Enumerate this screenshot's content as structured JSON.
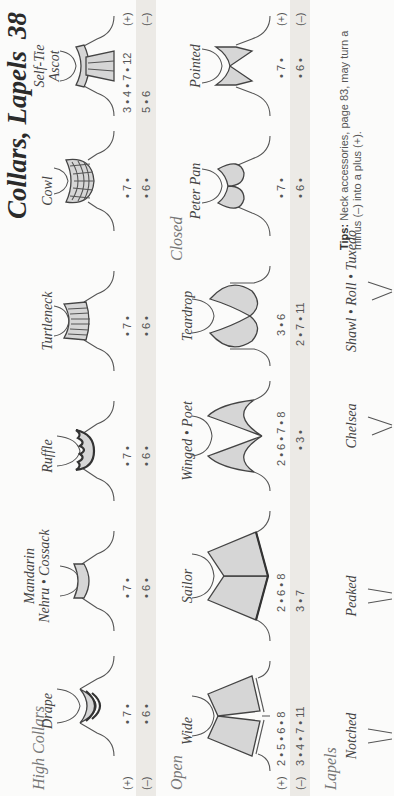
{
  "header": {
    "title": "Collars, Lapels",
    "page_number": "38"
  },
  "sections": {
    "high_collars": {
      "title": "High Collars",
      "plus_label": "(+)",
      "minus_label": "(–)",
      "items": [
        {
          "name": "Drape",
          "plus": "• 7 •",
          "minus": "• 6 •"
        },
        {
          "name": "Mandarin",
          "name_line2": "Nehru • Cossack",
          "plus": "• 7 •",
          "minus": "• 6 •"
        },
        {
          "name": "Ruffle",
          "plus": "• 7 •",
          "minus": "• 6 •"
        },
        {
          "name": "Turtleneck",
          "plus": "• 7 •",
          "minus": "• 6 •"
        },
        {
          "name": "Cowl",
          "plus": "• 7 •",
          "minus": "• 6 •"
        },
        {
          "name": "Self-Tie",
          "name_line2": "Ascot",
          "plus": "3 • 4 • 7 • 12",
          "minus": "5 • 6"
        }
      ],
      "right_plus": "(+)",
      "right_minus": "(–)"
    },
    "open": {
      "title": "Open",
      "plus_label": "(+)",
      "minus_label": "(–)",
      "items": [
        {
          "name": "Wide",
          "plus": "2 • 5 • 6 • 8",
          "minus": "3 • 4 • 7 • 11"
        },
        {
          "name": "Sailor",
          "plus": "2 • 6 • 8",
          "minus": "3 • 7"
        },
        {
          "name": "Winged • Poet",
          "plus": "2 • 6 • 7 • 8",
          "minus": "• 3 •"
        },
        {
          "name": "Teardrop",
          "plus": "3 • 6",
          "minus": "2 • 7 • 11"
        }
      ]
    },
    "closed": {
      "title": "Closed",
      "items": [
        {
          "name": "Peter Pan",
          "plus": "• 7 •",
          "minus": "• 6 •"
        },
        {
          "name": "Pointed",
          "plus": "• 7 •",
          "minus": "• 6 •"
        }
      ],
      "right_plus": "(+)",
      "right_minus": "(–)"
    },
    "lapels": {
      "title": "Lapels",
      "items": [
        {
          "name": "Notched"
        },
        {
          "name": "Peaked"
        },
        {
          "name": "Chelsea"
        },
        {
          "name": "Shawl • Roll • Tuxedo"
        }
      ]
    }
  },
  "tips": {
    "label": "Tips:",
    "text": "Neck accessories, page 83, may turn a minus (–) into a plus (+)."
  },
  "colors": {
    "band": "#eceae6",
    "fill": "#d6d6d6",
    "ink": "#333333"
  }
}
